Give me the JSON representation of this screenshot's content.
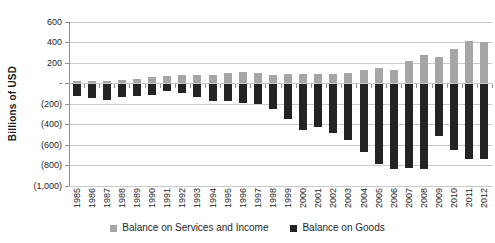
{
  "chart_data": {
    "type": "bar",
    "stacked": true,
    "title": "",
    "ylabel": "Billions of USD",
    "xlabel": "",
    "ylim": [
      -1000,
      600
    ],
    "ytick_step": 200,
    "ytick_labels": [
      "600",
      "400",
      "200",
      "-",
      "(200)",
      "(400)",
      "(600)",
      "(800)",
      "(1,000)"
    ],
    "grid": true,
    "legend_position": "bottom",
    "categories": [
      "1985",
      "1986",
      "1987",
      "1988",
      "1989",
      "1990",
      "1991",
      "1992",
      "1993",
      "1994",
      "1995",
      "1996",
      "1997",
      "1998",
      "1999",
      "2000",
      "2001",
      "2002",
      "2003",
      "2004",
      "2005",
      "2006",
      "2007",
      "2008",
      "2009",
      "2010",
      "2011",
      "2012"
    ],
    "series": [
      {
        "name": "Balance on Services and Income",
        "color": "#a6a6a6",
        "values": [
          26,
          22,
          22,
          31,
          44,
          59,
          70,
          82,
          87,
          84,
          99,
          109,
          103,
          86,
          97,
          96,
          96,
          89,
          99,
          129,
          148,
          130,
          224,
          282,
          256,
          332,
          419,
          408
        ]
      },
      {
        "name": "Balance on Goods",
        "color": "#232323",
        "values": [
          -122,
          -145,
          -160,
          -127,
          -118,
          -111,
          -77,
          -97,
          -132,
          -166,
          -174,
          -191,
          -198,
          -248,
          -346,
          -452,
          -427,
          -485,
          -551,
          -670,
          -787,
          -838,
          -821,
          -832,
          -510,
          -649,
          -741,
          -741
        ]
      }
    ]
  },
  "colors": {
    "gridline": "#c9c9c9",
    "axis": "#8f8f8f",
    "text": "#262626",
    "background": "#ffffff"
  }
}
